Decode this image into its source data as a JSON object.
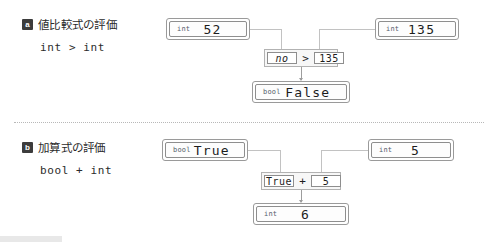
{
  "sections": [
    {
      "badge": "a",
      "title": "値比較式の評価",
      "code": "int > int",
      "operands": [
        {
          "type": "int",
          "value": "52"
        },
        {
          "type": "int",
          "value": "135"
        }
      ],
      "expression": {
        "left": "no",
        "operator": ">",
        "right": "135"
      },
      "result": {
        "type": "bool",
        "value": "False"
      }
    },
    {
      "badge": "b",
      "title": "加算式の評価",
      "code": "bool + int",
      "operands": [
        {
          "type": "bool",
          "value": "True"
        },
        {
          "type": "int",
          "value": "5"
        }
      ],
      "expression": {
        "left": "True",
        "operator": "+",
        "right": "5"
      },
      "result": {
        "type": "int",
        "value": "6"
      }
    }
  ],
  "colors": {
    "badge_bg": "#3c3c3c",
    "box_border": "#8e8e8e",
    "connector": "#c2c2c2",
    "op_bg": "#f7f7f7",
    "divider": "#b8b8b8"
  }
}
